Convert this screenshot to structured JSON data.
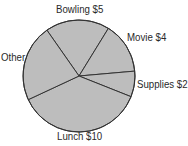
{
  "chart_data": {
    "type": "pie",
    "title": "",
    "center": [
      79,
      76
    ],
    "radius": 56,
    "start_angle_deg": 235,
    "fill_color": "#bdbdbd",
    "line_color": "#333333",
    "slices": [
      {
        "label": "Bowling $5",
        "name": "Bowling",
        "value": 5
      },
      {
        "label": "Movie $4",
        "name": "Movie",
        "value": 4
      },
      {
        "label": "Supplies $2",
        "name": "Supplies",
        "value": 2
      },
      {
        "label": "Lunch $10",
        "name": "Lunch",
        "value": 10
      },
      {
        "label": "Other",
        "name": "Other",
        "value": 6
      }
    ],
    "legend": "none (labels placed around pie)"
  },
  "labels": {
    "bowling": "Bowling $5",
    "movie": "Movie $4",
    "supplies": "Supplies $2",
    "lunch": "Lunch $10",
    "other": "Other"
  }
}
